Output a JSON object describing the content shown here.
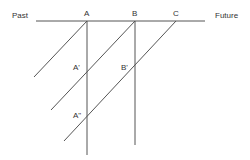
{
  "labels": {
    "past": "Past",
    "future": "Future",
    "a": "A",
    "b": "B",
    "c": "C",
    "a_prime": "A'",
    "b_prime": "B'",
    "a_double_prime": "A\""
  },
  "colors": {
    "line": "#555555",
    "text": "#333333",
    "background": "#ffffff"
  }
}
